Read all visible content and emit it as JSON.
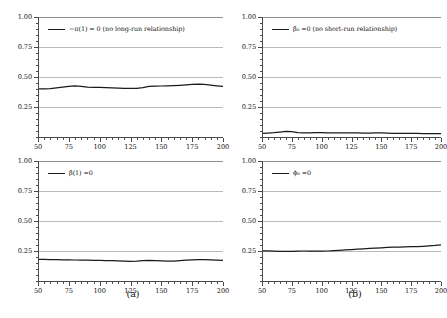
{
  "figure": {
    "captions": [
      {
        "id": "caption-a",
        "text": "(a)"
      },
      {
        "id": "caption-b",
        "text": "(b)"
      }
    ]
  },
  "chart_data": [
    {
      "panel": "top-left",
      "type": "line",
      "title": "",
      "legend": "−π(1) = 0 (no long-run relationship)",
      "legend_symbol": "−π(1) = 0",
      "legend_note": "(no long-run relationship)",
      "legend_position": "top-left",
      "xlabel": "",
      "ylabel": "",
      "xlim": [
        50,
        200
      ],
      "ylim": [
        0,
        1.0
      ],
      "xticks": [
        50,
        75,
        100,
        125,
        150,
        175,
        200
      ],
      "yticks": [
        0.25,
        0.5,
        0.75,
        1.0
      ],
      "ytick_labels": [
        "0.25",
        "0.50",
        "0.75",
        "1.00"
      ],
      "grid": true,
      "x": [
        50,
        55,
        60,
        65,
        70,
        75,
        80,
        85,
        90,
        95,
        100,
        105,
        110,
        115,
        120,
        125,
        130,
        135,
        140,
        145,
        150,
        155,
        160,
        165,
        170,
        175,
        180,
        185,
        190,
        195,
        200
      ],
      "values": [
        0.4,
        0.401,
        0.404,
        0.409,
        0.415,
        0.422,
        0.426,
        0.421,
        0.416,
        0.414,
        0.413,
        0.412,
        0.41,
        0.408,
        0.406,
        0.405,
        0.406,
        0.412,
        0.421,
        0.424,
        0.425,
        0.427,
        0.429,
        0.431,
        0.434,
        0.438,
        0.441,
        0.438,
        0.432,
        0.426,
        0.421
      ]
    },
    {
      "panel": "top-right",
      "type": "line",
      "title": "",
      "legend": "β₀ =0 (no short-run relationship)",
      "legend_symbol": "β₀ =0",
      "legend_note": "(no short-run relationship)",
      "legend_position": "top-left",
      "xlabel": "",
      "ylabel": "",
      "xlim": [
        50,
        200
      ],
      "ylim": [
        0,
        1.0
      ],
      "xticks": [
        50,
        75,
        100,
        125,
        150,
        175,
        200
      ],
      "yticks": [
        0.25,
        0.5,
        0.75,
        1.0
      ],
      "ytick_labels": [
        "0.25",
        "0.50",
        "0.75",
        "1.00"
      ],
      "grid": true,
      "x": [
        50,
        55,
        60,
        65,
        70,
        75,
        80,
        85,
        90,
        95,
        100,
        105,
        110,
        115,
        120,
        125,
        130,
        135,
        140,
        145,
        150,
        155,
        160,
        165,
        170,
        175,
        180,
        185,
        190,
        195,
        200
      ],
      "values": [
        0.031,
        0.033,
        0.036,
        0.041,
        0.047,
        0.044,
        0.037,
        0.034,
        0.035,
        0.036,
        0.036,
        0.035,
        0.034,
        0.034,
        0.035,
        0.035,
        0.034,
        0.033,
        0.033,
        0.034,
        0.035,
        0.033,
        0.031,
        0.03,
        0.03,
        0.03,
        0.03,
        0.029,
        0.029,
        0.029,
        0.029
      ]
    },
    {
      "panel": "bottom-left",
      "type": "line",
      "title": "",
      "legend": "β(1) =0",
      "legend_symbol": "β(1) =0",
      "legend_note": "",
      "legend_position": "top-left",
      "xlabel": "",
      "ylabel": "",
      "xlim": [
        50,
        200
      ],
      "ylim": [
        0,
        1.0
      ],
      "xticks": [
        50,
        75,
        100,
        125,
        150,
        175,
        200
      ],
      "yticks": [
        0.25,
        0.5,
        0.75,
        1.0
      ],
      "ytick_labels": [
        "0.25",
        "0.50",
        "0.75",
        "1.00"
      ],
      "grid": true,
      "x": [
        50,
        55,
        60,
        65,
        70,
        75,
        80,
        85,
        90,
        95,
        100,
        105,
        110,
        115,
        120,
        125,
        130,
        135,
        140,
        145,
        150,
        155,
        160,
        165,
        170,
        175,
        180,
        185,
        190,
        195,
        200
      ],
      "values": [
        0.18,
        0.18,
        0.179,
        0.178,
        0.177,
        0.176,
        0.175,
        0.174,
        0.173,
        0.172,
        0.171,
        0.17,
        0.169,
        0.167,
        0.165,
        0.164,
        0.166,
        0.17,
        0.172,
        0.17,
        0.167,
        0.165,
        0.166,
        0.169,
        0.173,
        0.176,
        0.178,
        0.178,
        0.176,
        0.173,
        0.171
      ]
    },
    {
      "panel": "bottom-right",
      "type": "line",
      "title": "",
      "legend": "ϕ₀ =0",
      "legend_symbol": "ϕ₀ =0",
      "legend_note": "",
      "legend_position": "top-left",
      "xlabel": "",
      "ylabel": "",
      "xlim": [
        50,
        200
      ],
      "ylim": [
        0,
        1.0
      ],
      "xticks": [
        50,
        75,
        100,
        125,
        150,
        175,
        200
      ],
      "yticks": [
        0.25,
        0.5,
        0.75,
        1.0
      ],
      "ytick_labels": [
        "0.25",
        "0.50",
        "0.75",
        "1.00"
      ],
      "grid": true,
      "x": [
        50,
        55,
        60,
        65,
        70,
        75,
        80,
        85,
        90,
        95,
        100,
        105,
        110,
        115,
        120,
        125,
        130,
        135,
        140,
        145,
        150,
        155,
        160,
        165,
        170,
        175,
        180,
        185,
        190,
        195,
        200
      ],
      "values": [
        0.252,
        0.251,
        0.249,
        0.247,
        0.246,
        0.247,
        0.249,
        0.25,
        0.25,
        0.249,
        0.248,
        0.25,
        0.253,
        0.256,
        0.259,
        0.262,
        0.265,
        0.268,
        0.271,
        0.274,
        0.277,
        0.28,
        0.282,
        0.283,
        0.285,
        0.286,
        0.287,
        0.289,
        0.292,
        0.296,
        0.302
      ]
    }
  ]
}
